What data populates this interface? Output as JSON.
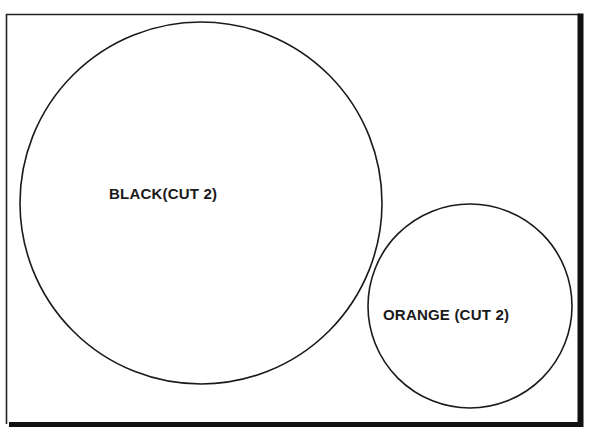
{
  "diagram": {
    "type": "proportional-circles",
    "frame": {
      "stroke": "#222222",
      "background": "#ffffff"
    },
    "circles": [
      {
        "id": "black",
        "label": "BLACK(CUT 2)",
        "cx": 201,
        "cy": 203,
        "r": 181
      },
      {
        "id": "orange",
        "label": "ORANGE (CUT 2)",
        "cx": 470,
        "cy": 306,
        "r": 102
      }
    ]
  }
}
